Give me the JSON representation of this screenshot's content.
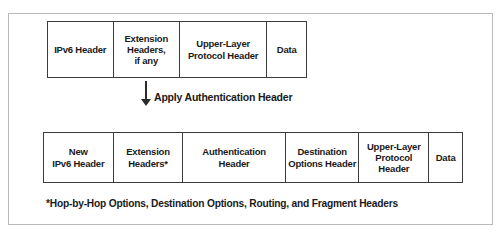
{
  "figure": {
    "colors": {
      "frame_border": "#b9b9b9",
      "box_border": "#3b3b3b",
      "text": "#1a1a1a",
      "arrow": "#2b2b2b",
      "background": "#ffffff"
    }
  },
  "top_packet": {
    "name": "Original IPv6 packet",
    "cells": [
      {
        "label": "IPv6 Header"
      },
      {
        "label": "Extension\nHeaders,\nif any"
      },
      {
        "label": "Upper-Layer\nProtocol Header"
      },
      {
        "label": "Data"
      }
    ]
  },
  "transform": {
    "arrow_icon": "down-arrow-icon",
    "label": "Apply Authentication Header"
  },
  "bottom_packet": {
    "name": "IPv6 packet after applying Authentication Header",
    "cells": [
      {
        "label": "New\nIPv6 Header"
      },
      {
        "label": "Extension\nHeaders*"
      },
      {
        "label": "Authentication\nHeader"
      },
      {
        "label": "Destination\nOptions Header"
      },
      {
        "label": "Upper-Layer\nProtocol\nHeader"
      },
      {
        "label": "Data"
      }
    ]
  },
  "footnote": {
    "text": "*Hop-by-Hop Options, Destination Options, Routing, and Fragment Headers"
  }
}
